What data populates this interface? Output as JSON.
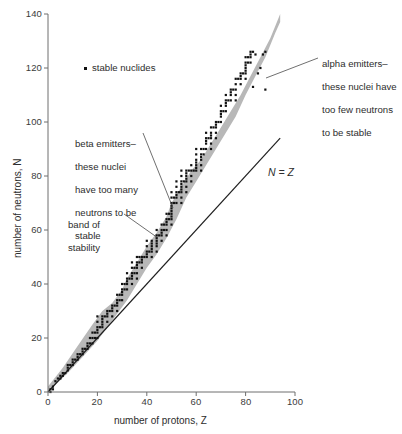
{
  "chart_data": {
    "type": "scatter",
    "title": "",
    "xlabel": "number of protons, Z",
    "ylabel": "number of neutrons, N",
    "xlim": [
      0,
      100
    ],
    "ylim": [
      0,
      140
    ],
    "xticks": [
      "0",
      "20",
      "40",
      "60",
      "80",
      "100"
    ],
    "ytick_values": [
      0,
      20,
      40,
      60,
      80,
      100,
      120,
      140
    ],
    "yticks": [
      "0",
      "20",
      "40",
      "60",
      "80",
      "100",
      "120",
      "140"
    ],
    "xtick_values": [
      0,
      20,
      40,
      60,
      80,
      100
    ],
    "grid": false,
    "legend_position": "upper-left-inside",
    "legend": [
      {
        "marker": "dot",
        "label": "stable nuclides",
        "color": "#111111"
      }
    ],
    "reference_line": {
      "label": "N = Z",
      "equation": "N = Z",
      "from": [
        0,
        0
      ],
      "to": [
        94,
        94
      ],
      "color": "#1f1f1f"
    },
    "band": {
      "name": "band of stability",
      "color": "#b8b8b8",
      "upper_edge": [
        [
          0,
          2
        ],
        [
          6,
          9
        ],
        [
          12,
          17
        ],
        [
          18,
          25
        ],
        [
          22,
          30
        ],
        [
          26,
          33
        ],
        [
          30,
          38
        ],
        [
          32,
          42
        ],
        [
          36,
          48
        ],
        [
          40,
          54
        ],
        [
          44,
          59
        ],
        [
          48,
          65
        ],
        [
          50,
          70
        ],
        [
          54,
          76
        ],
        [
          58,
          82
        ],
        [
          62,
          86
        ],
        [
          66,
          92
        ],
        [
          70,
          98
        ],
        [
          74,
          104
        ],
        [
          78,
          110
        ],
        [
          82,
          117
        ],
        [
          86,
          124
        ],
        [
          90,
          131
        ],
        [
          94,
          140
        ]
      ],
      "lower_edge": [
        [
          0,
          0
        ],
        [
          8,
          7
        ],
        [
          14,
          13
        ],
        [
          20,
          19
        ],
        [
          24,
          24
        ],
        [
          28,
          29
        ],
        [
          32,
          34
        ],
        [
          36,
          40
        ],
        [
          40,
          46
        ],
        [
          44,
          51
        ],
        [
          48,
          57
        ],
        [
          52,
          64
        ],
        [
          56,
          72
        ],
        [
          60,
          78
        ],
        [
          64,
          84
        ],
        [
          68,
          90
        ],
        [
          72,
          96
        ],
        [
          76,
          102
        ],
        [
          80,
          110
        ],
        [
          84,
          117
        ],
        [
          88,
          124
        ],
        [
          92,
          133
        ],
        [
          94,
          137
        ]
      ]
    },
    "series": [
      {
        "name": "stable nuclides",
        "marker": "square",
        "color": "#111111",
        "points": [
          [
            1,
            0
          ],
          [
            1,
            1
          ],
          [
            2,
            1
          ],
          [
            2,
            2
          ],
          [
            3,
            4
          ],
          [
            4,
            5
          ],
          [
            5,
            5
          ],
          [
            5,
            6
          ],
          [
            6,
            6
          ],
          [
            6,
            7
          ],
          [
            7,
            7
          ],
          [
            8,
            8
          ],
          [
            8,
            9
          ],
          [
            8,
            10
          ],
          [
            9,
            10
          ],
          [
            10,
            10
          ],
          [
            10,
            11
          ],
          [
            10,
            12
          ],
          [
            11,
            12
          ],
          [
            12,
            12
          ],
          [
            12,
            13
          ],
          [
            12,
            14
          ],
          [
            13,
            14
          ],
          [
            14,
            14
          ],
          [
            14,
            15
          ],
          [
            14,
            16
          ],
          [
            15,
            16
          ],
          [
            16,
            16
          ],
          [
            16,
            17
          ],
          [
            16,
            18
          ],
          [
            17,
            18
          ],
          [
            17,
            20
          ],
          [
            18,
            18
          ],
          [
            18,
            20
          ],
          [
            18,
            22
          ],
          [
            19,
            20
          ],
          [
            19,
            22
          ],
          [
            20,
            20
          ],
          [
            20,
            22
          ],
          [
            20,
            23
          ],
          [
            20,
            24
          ],
          [
            20,
            26
          ],
          [
            20,
            28
          ],
          [
            21,
            24
          ],
          [
            22,
            24
          ],
          [
            22,
            25
          ],
          [
            22,
            26
          ],
          [
            22,
            27
          ],
          [
            22,
            28
          ],
          [
            23,
            28
          ],
          [
            24,
            26
          ],
          [
            24,
            28
          ],
          [
            24,
            29
          ],
          [
            24,
            30
          ],
          [
            25,
            30
          ],
          [
            26,
            28
          ],
          [
            26,
            30
          ],
          [
            26,
            31
          ],
          [
            26,
            32
          ],
          [
            27,
            32
          ],
          [
            28,
            30
          ],
          [
            28,
            32
          ],
          [
            28,
            33
          ],
          [
            28,
            34
          ],
          [
            28,
            36
          ],
          [
            29,
            34
          ],
          [
            29,
            36
          ],
          [
            30,
            34
          ],
          [
            30,
            36
          ],
          [
            30,
            37
          ],
          [
            30,
            38
          ],
          [
            30,
            40
          ],
          [
            31,
            38
          ],
          [
            31,
            40
          ],
          [
            32,
            38
          ],
          [
            32,
            40
          ],
          [
            32,
            41
          ],
          [
            32,
            42
          ],
          [
            32,
            44
          ],
          [
            33,
            42
          ],
          [
            34,
            40
          ],
          [
            34,
            42
          ],
          [
            34,
            43
          ],
          [
            34,
            44
          ],
          [
            34,
            46
          ],
          [
            34,
            48
          ],
          [
            35,
            44
          ],
          [
            35,
            46
          ],
          [
            36,
            42
          ],
          [
            36,
            44
          ],
          [
            36,
            46
          ],
          [
            36,
            47
          ],
          [
            36,
            48
          ],
          [
            36,
            50
          ],
          [
            37,
            48
          ],
          [
            37,
            50
          ],
          [
            38,
            46
          ],
          [
            38,
            48
          ],
          [
            38,
            49
          ],
          [
            38,
            50
          ],
          [
            39,
            50
          ],
          [
            40,
            50
          ],
          [
            40,
            51
          ],
          [
            40,
            52
          ],
          [
            40,
            54
          ],
          [
            40,
            56
          ],
          [
            41,
            52
          ],
          [
            42,
            50
          ],
          [
            42,
            52
          ],
          [
            42,
            53
          ],
          [
            42,
            54
          ],
          [
            42,
            55
          ],
          [
            42,
            56
          ],
          [
            44,
            52
          ],
          [
            44,
            54
          ],
          [
            44,
            55
          ],
          [
            44,
            56
          ],
          [
            44,
            57
          ],
          [
            44,
            58
          ],
          [
            44,
            60
          ],
          [
            45,
            58
          ],
          [
            46,
            56
          ],
          [
            46,
            58
          ],
          [
            46,
            59
          ],
          [
            46,
            60
          ],
          [
            46,
            62
          ],
          [
            47,
            60
          ],
          [
            47,
            62
          ],
          [
            48,
            58
          ],
          [
            48,
            60
          ],
          [
            48,
            62
          ],
          [
            48,
            63
          ],
          [
            48,
            64
          ],
          [
            48,
            66
          ],
          [
            49,
            64
          ],
          [
            49,
            66
          ],
          [
            50,
            62
          ],
          [
            50,
            64
          ],
          [
            50,
            65
          ],
          [
            50,
            66
          ],
          [
            50,
            67
          ],
          [
            50,
            68
          ],
          [
            50,
            69
          ],
          [
            50,
            70
          ],
          [
            50,
            72
          ],
          [
            50,
            74
          ],
          [
            51,
            70
          ],
          [
            51,
            72
          ],
          [
            52,
            70
          ],
          [
            52,
            72
          ],
          [
            52,
            73
          ],
          [
            52,
            74
          ],
          [
            52,
            76
          ],
          [
            52,
            78
          ],
          [
            53,
            74
          ],
          [
            54,
            70
          ],
          [
            54,
            72
          ],
          [
            54,
            74
          ],
          [
            54,
            75
          ],
          [
            54,
            76
          ],
          [
            54,
            77
          ],
          [
            54,
            78
          ],
          [
            54,
            80
          ],
          [
            54,
            82
          ],
          [
            55,
            78
          ],
          [
            56,
            74
          ],
          [
            56,
            76
          ],
          [
            56,
            78
          ],
          [
            56,
            79
          ],
          [
            56,
            80
          ],
          [
            56,
            81
          ],
          [
            56,
            82
          ],
          [
            57,
            82
          ],
          [
            58,
            78
          ],
          [
            58,
            80
          ],
          [
            58,
            82
          ],
          [
            58,
            84
          ],
          [
            59,
            82
          ],
          [
            60,
            82
          ],
          [
            60,
            83
          ],
          [
            60,
            84
          ],
          [
            60,
            85
          ],
          [
            60,
            86
          ],
          [
            60,
            88
          ],
          [
            60,
            90
          ],
          [
            62,
            82
          ],
          [
            62,
            84
          ],
          [
            62,
            86
          ],
          [
            62,
            87
          ],
          [
            62,
            88
          ],
          [
            62,
            90
          ],
          [
            63,
            88
          ],
          [
            63,
            90
          ],
          [
            64,
            90
          ],
          [
            64,
            92
          ],
          [
            64,
            93
          ],
          [
            64,
            94
          ],
          [
            64,
            96
          ],
          [
            65,
            94
          ],
          [
            66,
            90
          ],
          [
            66,
            92
          ],
          [
            66,
            94
          ],
          [
            66,
            95
          ],
          [
            66,
            96
          ],
          [
            66,
            98
          ],
          [
            67,
            98
          ],
          [
            68,
            94
          ],
          [
            68,
            96
          ],
          [
            68,
            98
          ],
          [
            68,
            99
          ],
          [
            68,
            100
          ],
          [
            69,
            100
          ],
          [
            70,
            100
          ],
          [
            70,
            102
          ],
          [
            70,
            103
          ],
          [
            70,
            104
          ],
          [
            70,
            106
          ],
          [
            71,
            104
          ],
          [
            72,
            104
          ],
          [
            72,
            106
          ],
          [
            72,
            107
          ],
          [
            72,
            108
          ],
          [
            72,
            110
          ],
          [
            73,
            108
          ],
          [
            74,
            108
          ],
          [
            74,
            110
          ],
          [
            74,
            111
          ],
          [
            74,
            112
          ],
          [
            75,
            112
          ],
          [
            76,
            108
          ],
          [
            76,
            110
          ],
          [
            76,
            112
          ],
          [
            76,
            114
          ],
          [
            76,
            116
          ],
          [
            77,
            116
          ],
          [
            78,
            114
          ],
          [
            78,
            116
          ],
          [
            78,
            117
          ],
          [
            78,
            118
          ],
          [
            79,
            118
          ],
          [
            80,
            116
          ],
          [
            80,
            118
          ],
          [
            80,
            119
          ],
          [
            80,
            120
          ],
          [
            80,
            121
          ],
          [
            80,
            122
          ],
          [
            80,
            124
          ],
          [
            81,
            122
          ],
          [
            81,
            124
          ],
          [
            82,
            122
          ],
          [
            82,
            124
          ],
          [
            82,
            125
          ],
          [
            82,
            126
          ],
          [
            83,
            126
          ],
          [
            83,
            113
          ],
          [
            84,
            125
          ],
          [
            85,
            118
          ],
          [
            86,
            120
          ],
          [
            87,
            125
          ],
          [
            88,
            126
          ],
          [
            88,
            112
          ]
        ]
      }
    ],
    "annotations": [
      {
        "name": "alpha-emitters",
        "text": "alpha emitters–\nthese nuclei have\ntoo few neutrons\nto be stable",
        "target": [
          86,
          116
        ]
      },
      {
        "name": "beta-emitters",
        "text": "beta emitters–\nthese nuclei\nhave too many\nneutrons to be\nstable",
        "target": [
          51,
          69
        ]
      },
      {
        "name": "band-of-stability",
        "text": "band of\nstability",
        "target": [
          45,
          57
        ]
      }
    ]
  },
  "legend": {
    "stable_label": "stable nuclides"
  },
  "annotations": {
    "alpha": {
      "line1": "alpha emitters–",
      "line2": "these nuclei have",
      "line3": "too few neutrons",
      "line4": "to be stable"
    },
    "beta": {
      "line1": "beta emitters–",
      "line2": "these nuclei",
      "line3": "have too many",
      "line4": "neutrons to be",
      "line5": "stable"
    },
    "band": {
      "line1": "band of",
      "line2": "stability"
    },
    "nz": "N = Z"
  },
  "axes": {
    "x_title": "number of protons, Z",
    "y_title": "number of neutrons, N",
    "x_ticks": [
      "0",
      "20",
      "40",
      "60",
      "80",
      "100"
    ],
    "y_ticks": [
      "140",
      "120",
      "100",
      "80",
      "60",
      "40",
      "20",
      "0"
    ]
  },
  "colors": {
    "band": "#b8b8b8",
    "dots": "#111111",
    "axis": "#6f6f6f",
    "text": "#2d2d2d",
    "line": "#1f1f1f"
  }
}
